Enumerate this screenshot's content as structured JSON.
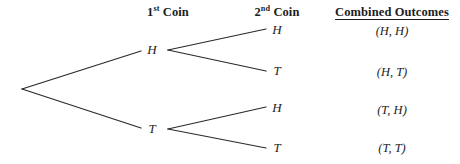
{
  "diagram": {
    "type": "probability-tree",
    "background_color": "#ffffff",
    "line_color": "#2a2a2a",
    "text_color": "#1d1d1d",
    "headers": [
      {
        "id": "first-coin",
        "prefix": "1",
        "sup": "st",
        "suffix": " Coin",
        "x": 168,
        "y": 5,
        "underlined": false
      },
      {
        "id": "second-coin",
        "prefix": "2",
        "sup": "nd",
        "suffix": " Coin",
        "x": 277,
        "y": 5,
        "underlined": false
      },
      {
        "id": "combined-outcomes",
        "prefix": "Combined Outcomes",
        "sup": "",
        "suffix": "",
        "x": 392,
        "y": 5,
        "underlined": true
      }
    ],
    "nodes": [
      {
        "id": "root",
        "label": "",
        "x": 22,
        "y": 89
      },
      {
        "id": "level1-h",
        "label": "H",
        "x": 152,
        "y": 50
      },
      {
        "id": "level1-t",
        "label": "T",
        "x": 152,
        "y": 129
      },
      {
        "id": "level2-hh",
        "label": "H",
        "x": 277,
        "y": 30
      },
      {
        "id": "level2-ht",
        "label": "T",
        "x": 277,
        "y": 71
      },
      {
        "id": "level2-th",
        "label": "H",
        "x": 277,
        "y": 108
      },
      {
        "id": "level2-tt",
        "label": "T",
        "x": 277,
        "y": 148
      }
    ],
    "branches": [
      {
        "id": "root-to-h",
        "x1": 22,
        "y1": 89,
        "x2": 141,
        "y2": 51
      },
      {
        "id": "root-to-t",
        "x1": 22,
        "y1": 89,
        "x2": 141,
        "y2": 128
      },
      {
        "id": "h-to-hh",
        "x1": 168,
        "y1": 50,
        "x2": 266,
        "y2": 29
      },
      {
        "id": "h-to-ht",
        "x1": 168,
        "y1": 50,
        "x2": 266,
        "y2": 71
      },
      {
        "id": "t-to-th",
        "x1": 168,
        "y1": 129,
        "x2": 266,
        "y2": 107
      },
      {
        "id": "t-to-tt",
        "x1": 168,
        "y1": 129,
        "x2": 266,
        "y2": 148
      }
    ],
    "outcomes": [
      {
        "id": "outcome-hh",
        "label": "(H, H)",
        "x": 392,
        "y": 31
      },
      {
        "id": "outcome-ht",
        "label": "(H, T)",
        "x": 392,
        "y": 72
      },
      {
        "id": "outcome-th",
        "label": "(T, H)",
        "x": 392,
        "y": 110
      },
      {
        "id": "outcome-tt",
        "label": "(T, T)",
        "x": 392,
        "y": 148
      }
    ]
  }
}
